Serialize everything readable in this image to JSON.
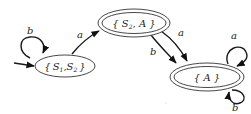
{
  "diagram": {
    "type": "finite-automaton",
    "states": [
      {
        "id": "s1s2",
        "label_open": "{",
        "var1": "S",
        "sub1": "1",
        "sep": ",",
        "var2": "S",
        "sub2": "2",
        "label_close": "}",
        "full_label": "{S1,S2}",
        "initial": true,
        "accepting": false
      },
      {
        "id": "s2a",
        "label": "{S2,A}",
        "var1": "S",
        "sub1": "2",
        "var2": "A",
        "initial": false,
        "accepting": true
      },
      {
        "id": "a",
        "label": "{A}",
        "var1": "A",
        "initial": false,
        "accepting": true
      }
    ],
    "transitions": [
      {
        "from": "{S1,S2}",
        "to": "{S1,S2}",
        "symbol": "b"
      },
      {
        "from": "{S1,S2}",
        "to": "{S2,A}",
        "symbol": "a"
      },
      {
        "from": "{S2,A}",
        "to": "{A}",
        "symbol": "a"
      },
      {
        "from": "{S2,A}",
        "to": "{A}",
        "symbol": "b"
      },
      {
        "from": "{A}",
        "to": "{A}",
        "symbol": "a"
      },
      {
        "from": "{A}",
        "to": "{A}",
        "symbol": "b"
      }
    ],
    "colors": {
      "stroke": "#1a1a1a",
      "background": "#ffffff"
    }
  }
}
